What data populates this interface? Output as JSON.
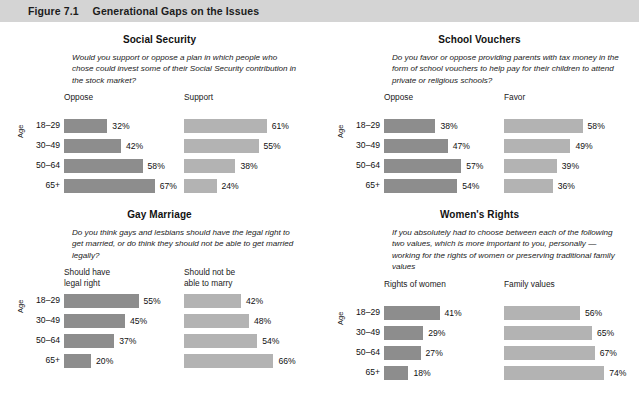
{
  "figure": {
    "number": "Figure 7.1",
    "title": "Generational Gaps on the Issues"
  },
  "axis_label": "Age",
  "colors": {
    "header_bar": "#d4d4d4",
    "bar_dark": "#8d8d8d",
    "bar_light": "#b3b3b3",
    "text": "#1a1a1a"
  },
  "chart_data": [
    {
      "type": "bar",
      "title": "Social Security",
      "subtitle": "Would you support or oppose a plan in which people who chose could invest some of their Social Security contribution in the stock market?",
      "xlabel": "",
      "ylabel": "Age",
      "categories": [
        "18–29",
        "30–49",
        "50–64",
        "65+"
      ],
      "xlim": [
        0,
        100
      ],
      "grid": false,
      "legend": "column-headers",
      "series": [
        {
          "name": "Oppose",
          "values": [
            32,
            42,
            58,
            67
          ],
          "labels": [
            "32%",
            "42%",
            "58%",
            "67%"
          ],
          "color": "#8d8d8d"
        },
        {
          "name": "Support",
          "values": [
            61,
            55,
            38,
            24
          ],
          "labels": [
            "61%",
            "55%",
            "38%",
            "24%"
          ],
          "color": "#b3b3b3"
        }
      ]
    },
    {
      "type": "bar",
      "title": "School Vouchers",
      "subtitle": "Do you favor or oppose providing parents with tax money in the form of school vouchers to help pay for their children to attend private or religious schools?",
      "xlabel": "",
      "ylabel": "Age",
      "categories": [
        "18–29",
        "30–49",
        "50–64",
        "65+"
      ],
      "xlim": [
        0,
        100
      ],
      "grid": false,
      "legend": "column-headers",
      "series": [
        {
          "name": "Oppose",
          "values": [
            38,
            47,
            57,
            54
          ],
          "labels": [
            "38%",
            "47%",
            "57%",
            "54%"
          ],
          "color": "#8d8d8d"
        },
        {
          "name": "Favor",
          "values": [
            58,
            49,
            39,
            36
          ],
          "labels": [
            "58%",
            "49%",
            "39%",
            "36%"
          ],
          "color": "#b3b3b3"
        }
      ]
    },
    {
      "type": "bar",
      "title": "Gay Marriage",
      "subtitle": "Do you think gays and lesbians should have the legal right to get married, or do think they should not be able to get married legally?",
      "xlabel": "",
      "ylabel": "Age",
      "categories": [
        "18–29",
        "30–49",
        "50–64",
        "65+"
      ],
      "xlim": [
        0,
        100
      ],
      "grid": false,
      "legend": "column-headers",
      "series": [
        {
          "name": "Should have\nlegal right",
          "values": [
            55,
            45,
            37,
            20
          ],
          "labels": [
            "55%",
            "45%",
            "37%",
            "20%"
          ],
          "color": "#8d8d8d"
        },
        {
          "name": "Should not be\nable to marry",
          "values": [
            42,
            48,
            54,
            66
          ],
          "labels": [
            "42%",
            "48%",
            "54%",
            "66%"
          ],
          "color": "#b3b3b3"
        }
      ]
    },
    {
      "type": "bar",
      "title": "Women's Rights",
      "subtitle": "If you absolutely had to choose between each of the following two values, which is more important to you, personally — working for the rights of women or preserving traditional family values",
      "xlabel": "",
      "ylabel": "Age",
      "categories": [
        "18–29",
        "30–49",
        "50–64",
        "65+"
      ],
      "xlim": [
        0,
        100
      ],
      "grid": false,
      "legend": "column-headers",
      "series": [
        {
          "name": "Rights of women",
          "values": [
            41,
            29,
            27,
            18
          ],
          "labels": [
            "41%",
            "29%",
            "27%",
            "18%"
          ],
          "color": "#8d8d8d"
        },
        {
          "name": "Family values",
          "values": [
            56,
            65,
            67,
            74
          ],
          "labels": [
            "56%",
            "65%",
            "67%",
            "74%"
          ],
          "color": "#b3b3b3"
        }
      ]
    }
  ]
}
